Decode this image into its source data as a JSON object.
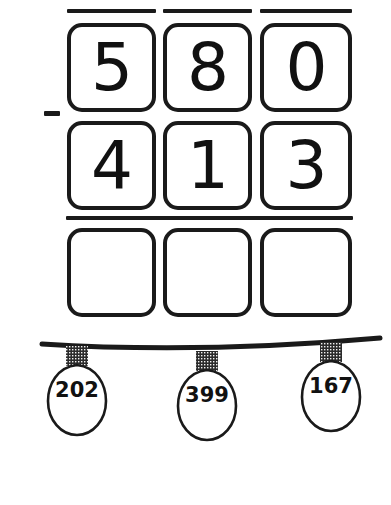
{
  "worksheet": {
    "kind": "subtraction-problem",
    "operator": "−",
    "minuend": {
      "value": "580",
      "digits": [
        "5",
        "8",
        "0"
      ]
    },
    "subtrahend": {
      "value": "413",
      "digits": [
        "4",
        "1",
        "3"
      ]
    },
    "answer": {
      "digits": [
        "",
        "",
        ""
      ]
    },
    "columns": 3
  },
  "garland": {
    "name": "christmas-lights-answer-choices",
    "bulbs": [
      {
        "label": "202"
      },
      {
        "label": "399"
      },
      {
        "label": "167"
      }
    ]
  },
  "colors": {
    "ink": "#1a1a1a",
    "glyph": "#111111",
    "paper": "#ffffff",
    "cap": "#2b2b2b"
  }
}
